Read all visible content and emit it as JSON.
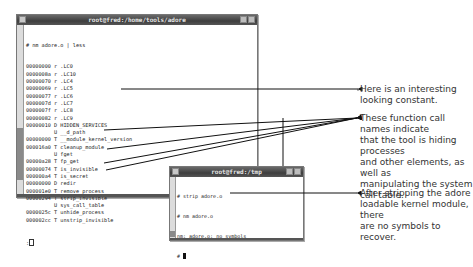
{
  "main_window": {
    "title": "root@fred:/home/tools/adore",
    "command": "# nm adore.o | less",
    "lines": [
      {
        "addr": "00000000",
        "type": "r",
        "name": ".LC0"
      },
      {
        "addr": "0000008a",
        "type": "r",
        "name": ".LC10"
      },
      {
        "addr": "00000070",
        "type": "r",
        "name": ".LC4"
      },
      {
        "addr": "00000069",
        "type": "r",
        "name": ".LC5"
      },
      {
        "addr": "00000077",
        "type": "r",
        "name": ".LC6"
      },
      {
        "addr": "0000007d",
        "type": "r",
        "name": ".LC7"
      },
      {
        "addr": "0000007f",
        "type": "r",
        "name": ".LC8"
      },
      {
        "addr": "00000082",
        "type": "r",
        "name": ".LC9"
      },
      {
        "addr": "00000010",
        "type": "D",
        "name": "HIDDEN_SERVICES"
      },
      {
        "addr": "        ",
        "type": "U",
        "name": "__d_path"
      },
      {
        "addr": "00000000",
        "type": "T",
        "name": "__module_kernel_version"
      },
      {
        "addr": "000016a0",
        "type": "T",
        "name": "cleanup_module"
      },
      {
        "addr": "        ",
        "type": "U",
        "name": "fget"
      },
      {
        "addr": "00000a28",
        "type": "T",
        "name": "fp_get"
      },
      {
        "addr": "00000074",
        "type": "T",
        "name": "is_invisible"
      },
      {
        "addr": "000000a4",
        "type": "T",
        "name": "is_secret"
      },
      {
        "addr": "00000000",
        "type": "D",
        "name": "redir"
      },
      {
        "addr": "000001e0",
        "type": "T",
        "name": "remove_process"
      },
      {
        "addr": "00000294",
        "type": "T",
        "name": "strip_invisible"
      },
      {
        "addr": "        ",
        "type": "U",
        "name": "sys_call_table"
      },
      {
        "addr": "0000025c",
        "type": "T",
        "name": "unhide_process"
      },
      {
        "addr": "000002cc",
        "type": "T",
        "name": "unstrip_invisible"
      }
    ],
    "prompt": ":"
  },
  "second_window": {
    "title": "root@fred:/tmp",
    "lines": [
      "# strip adore.o",
      "# nm adore.o",
      "nm: adore.o: no symbols",
      "#"
    ]
  },
  "annotations": {
    "constant_note": [
      "Here is an interesting",
      "looking constant."
    ],
    "functions_note": [
      "These function call names indicate",
      "that the tool is hiding processes",
      "and other elements, as well as",
      "manipulating the system call table."
    ],
    "stripped_note": [
      "After stripping the adore",
      "loadable kernel module, there",
      "are no symbols to recover."
    ]
  }
}
